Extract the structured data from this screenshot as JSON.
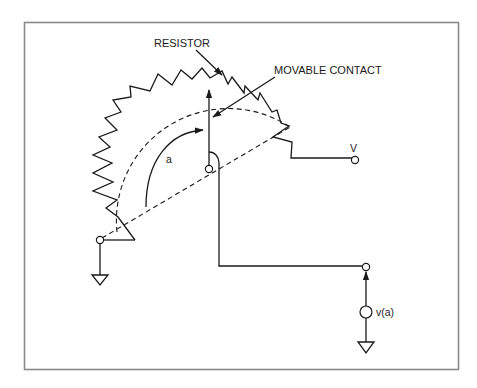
{
  "figure": {
    "frame_color": "#8a8a8a",
    "ink_color": "#1a1a1a",
    "background": "#ffffff"
  },
  "labels": {
    "resistor": "RESISTOR",
    "movable_contact": "MOVABLE CONTACT",
    "angle": "a",
    "supply_voltage": "V",
    "output_voltage": "v(a)"
  },
  "components": [
    {
      "name": "resistor",
      "type": "zigzag-arc",
      "label": "RESISTOR"
    },
    {
      "name": "movable-contact",
      "type": "wiper-arrow",
      "label": "MOVABLE CONTACT"
    },
    {
      "name": "pivot",
      "type": "terminal"
    },
    {
      "name": "left-terminal",
      "type": "terminal",
      "connected_to": "ground"
    },
    {
      "name": "supply-terminal",
      "type": "terminal",
      "label": "V"
    },
    {
      "name": "output-terminal",
      "type": "terminal"
    },
    {
      "name": "output-source",
      "type": "voltage-source",
      "label": "v(a)",
      "connected_to": "ground"
    }
  ]
}
